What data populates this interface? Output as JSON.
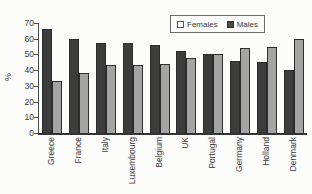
{
  "chart_data": {
    "type": "bar",
    "title": "",
    "ylabel": "%",
    "xlabel": "",
    "ylim": [
      0,
      70
    ],
    "yticks": [
      0,
      10,
      20,
      30,
      40,
      50,
      60,
      70
    ],
    "grid": false,
    "legend_position": "top",
    "categories": [
      "Greece",
      "France",
      "Italy",
      "Luxembourg",
      "Belgium",
      "UK",
      "Portugal",
      "Germany",
      "Holland",
      "Denmark"
    ],
    "series": [
      {
        "name": "Females",
        "swatch_color": "#fdfdfc",
        "bar_color": "#a4a4a4",
        "values": [
          33,
          38,
          43,
          43,
          44,
          48,
          50,
          54,
          55,
          60
        ]
      },
      {
        "name": "Males",
        "swatch_color": "#4a4a4a",
        "bar_color": "#3d3d3d",
        "values": [
          66,
          60,
          57,
          57,
          56,
          52,
          50,
          46,
          45,
          40
        ]
      }
    ],
    "bar_draw_order": [
      1,
      0
    ]
  },
  "colors": {
    "background": "#fcfcfa",
    "axis": "#4a4a4a",
    "baseline": "#333333",
    "text": "#3a3a3a",
    "bar_outline": "#2c2c2c",
    "legend_border": "#6b6b6b"
  }
}
